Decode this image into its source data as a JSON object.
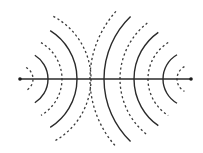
{
  "diagram": {
    "type": "two-source wave interference",
    "colors": {
      "line": "#2a2a2a",
      "background": "#ffffff"
    },
    "axis": {
      "y": 79,
      "x1": 20,
      "x2": 191
    },
    "sources": [
      {
        "name": "left-source",
        "x": 20,
        "y": 79
      },
      {
        "name": "right-source",
        "x": 191,
        "y": 79
      }
    ],
    "wavefronts": {
      "left": [
        {
          "r": 13,
          "style": "dashed",
          "span": 62
        },
        {
          "r": 28,
          "style": "solid",
          "span": 58
        },
        {
          "r": 42,
          "style": "dashed",
          "span": 60
        },
        {
          "r": 57,
          "style": "solid",
          "span": 58
        },
        {
          "r": 71,
          "style": "dashed",
          "span": 62
        }
      ],
      "right": [
        {
          "r": 14,
          "style": "dashed",
          "span": 62
        },
        {
          "r": 28,
          "style": "solid",
          "span": 60
        },
        {
          "r": 43,
          "style": "dashed",
          "span": 58
        },
        {
          "r": 57,
          "style": "solid",
          "span": 55
        },
        {
          "r": 71,
          "style": "dashed",
          "span": 52
        },
        {
          "r": 87,
          "style": "solid",
          "span": 46
        },
        {
          "r": 101,
          "style": "dashed",
          "span": 42
        }
      ]
    },
    "legend": {
      "solid": "crest",
      "dashed": "trough"
    }
  }
}
